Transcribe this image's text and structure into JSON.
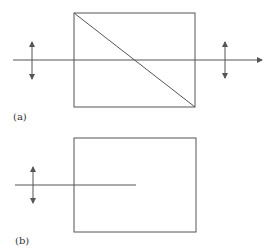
{
  "diagram": {
    "stroke_color": "#555555",
    "panels": [
      {
        "id": "a",
        "label": "(a)",
        "box": {
          "x": 74,
          "y": 13,
          "width": 121,
          "height": 94
        },
        "diagonal": {
          "x1": 74,
          "y1": 13,
          "x2": 195,
          "y2": 107
        },
        "beam": {
          "x1": 13,
          "y": 60,
          "x2": 262,
          "arrow_end": true
        },
        "polarization_arrows": [
          {
            "x": 32,
            "y1": 42,
            "y2": 79
          },
          {
            "x": 225,
            "y1": 42,
            "y2": 78
          }
        ]
      },
      {
        "id": "b",
        "label": "(b)",
        "box": {
          "x": 74,
          "y": 138,
          "width": 122,
          "height": 94
        },
        "beam": {
          "x1": 15,
          "y": 185,
          "x2": 136,
          "arrow_end": false
        },
        "polarization_arrows": [
          {
            "x": 33,
            "y1": 167,
            "y2": 203
          }
        ]
      }
    ]
  }
}
